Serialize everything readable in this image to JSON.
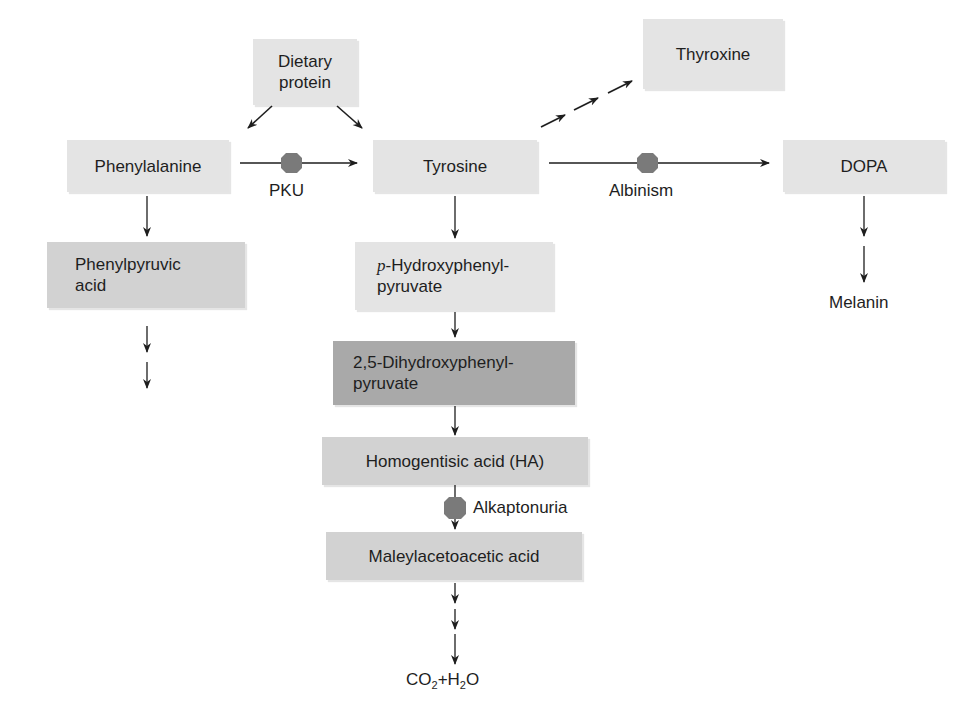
{
  "nodes": {
    "dietary_protein": {
      "line1": "Dietary",
      "line2": "protein"
    },
    "phenylalanine": "Phenylalanine",
    "tyrosine": "Tyrosine",
    "thyroxine": "Thyroxine",
    "dopa": "DOPA",
    "melanin": "Melanin",
    "phenylpyruvic_acid": {
      "line1": "Phenylpyruvic",
      "line2": "acid"
    },
    "p_hydroxyphenylpyruvate": {
      "prefix": "p",
      "line1": "-Hydroxyphenyl-",
      "line2": "pyruvate"
    },
    "dihydroxyphenylpyruvate": {
      "line1": "2,5-Dihydroxyphenyl-",
      "line2": "pyruvate"
    },
    "homogentisic_acid": "Homogentisic acid (HA)",
    "maleylacetoacetic_acid": "Maleylacetoacetic acid",
    "end_product": {
      "co": "CO",
      "sub1": "2",
      "plus_h": "+H",
      "sub2": "2",
      "o": "O"
    }
  },
  "disorders": {
    "pku": "PKU",
    "albinism": "Albinism",
    "alkaptonuria": "Alkaptonuria"
  },
  "colors": {
    "light_box": "#e4e4e4",
    "mid_box": "#d2d2d2",
    "dark_box": "#a9a9a9",
    "block_marker": "#7a7a7a",
    "arrow": "#1e1e1e"
  }
}
